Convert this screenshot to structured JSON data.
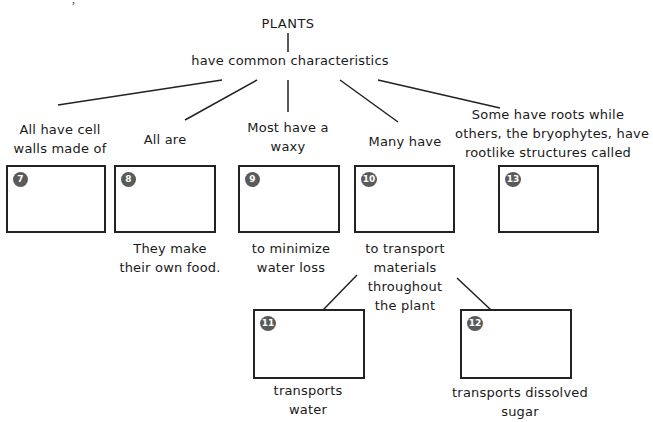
{
  "header_clipped": "·  · , ·   ·   ·   ·  · ·  ·   ·   ·   ·  ·   ·  ·",
  "root": "PLANTS",
  "link": "have common characteristics",
  "branches": [
    {
      "prompt": [
        "All have cell",
        "walls made of"
      ],
      "box_number": "7",
      "answer": "",
      "note": []
    },
    {
      "prompt": [
        "All are"
      ],
      "box_number": "8",
      "answer": "",
      "note": [
        "They make",
        "their own food."
      ]
    },
    {
      "prompt": [
        "Most have a",
        "waxy"
      ],
      "box_number": "9",
      "answer": "",
      "note": [
        "to minimize",
        "water loss"
      ]
    },
    {
      "prompt": [
        "Many have"
      ],
      "box_number": "10",
      "answer": "",
      "note": [
        "to transport",
        "materials",
        "throughout",
        "the plant"
      ]
    },
    {
      "prompt": [
        "Some have roots while",
        "others, the bryophytes, have",
        "rootlike structures called"
      ],
      "box_number": "13",
      "answer": "",
      "note": []
    }
  ],
  "sub_branches": [
    {
      "box_number": "11",
      "answer": "",
      "note": [
        "transports",
        "water"
      ]
    },
    {
      "box_number": "12",
      "answer": "",
      "note": [
        "transports dissolved",
        "sugar"
      ]
    }
  ]
}
